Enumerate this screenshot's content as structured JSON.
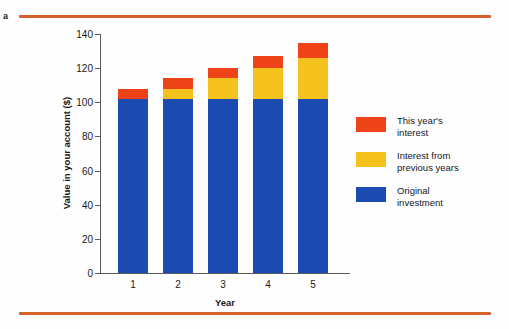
{
  "figure": {
    "panel_label": "a",
    "rule_color": "#d4622a"
  },
  "legend": {
    "items": [
      {
        "label_line1": "This year's",
        "label_line2": "interest",
        "color": "#ee4318",
        "key": "this_year"
      },
      {
        "label_line1": "Interest from",
        "label_line2": "previous years",
        "color": "#f5c21d",
        "key": "previous_years"
      },
      {
        "label_line1": "Original",
        "label_line2": "investment",
        "color": "#1b4bb0",
        "key": "original"
      }
    ]
  },
  "chart_data": {
    "type": "bar",
    "stacked": true,
    "title": "",
    "xlabel": "Year",
    "ylabel": "Value in your account ($)",
    "categories": [
      "1",
      "2",
      "3",
      "4",
      "5"
    ],
    "ylim": [
      0,
      140
    ],
    "yticks": [
      0,
      20,
      40,
      60,
      80,
      100,
      120,
      140
    ],
    "ytick_labels": [
      "0",
      "20",
      "40",
      "60",
      "80",
      "100",
      "120",
      "140"
    ],
    "grid": false,
    "legend_position": "right",
    "series": [
      {
        "name": "Original investment",
        "color": "#1b4bb0",
        "values": [
          102,
          102,
          102,
          102,
          102
        ]
      },
      {
        "name": "Interest from previous years",
        "color": "#f5c21d",
        "values": [
          0,
          6,
          12,
          18,
          24
        ]
      },
      {
        "name": "This year's interest",
        "color": "#ee4318",
        "values": [
          6,
          6,
          6,
          7,
          9
        ]
      }
    ],
    "totals": [
      108,
      114,
      120,
      127,
      135
    ]
  }
}
